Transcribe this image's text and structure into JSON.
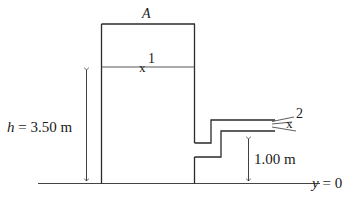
{
  "diagram": {
    "tank_label": "A",
    "point1_label": "1",
    "point2_label": "2",
    "marker": "x",
    "height_label_var": "h",
    "height_label_value": " = 3.50 m",
    "outlet_height_label": "1.00 m",
    "datum_label_var": "y",
    "datum_label_value": " = 0"
  },
  "colors": {
    "line": "#2a2a2a",
    "water_line": "#555555",
    "background": "#ffffff"
  }
}
